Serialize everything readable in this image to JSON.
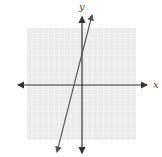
{
  "graph": {
    "x_label": "x",
    "y_label": "y",
    "grid_color": "#e0e0e0",
    "grid_bg": "#ececec",
    "axis_color": "#333333",
    "line_color": "#555555",
    "grid_squares": 20
  }
}
